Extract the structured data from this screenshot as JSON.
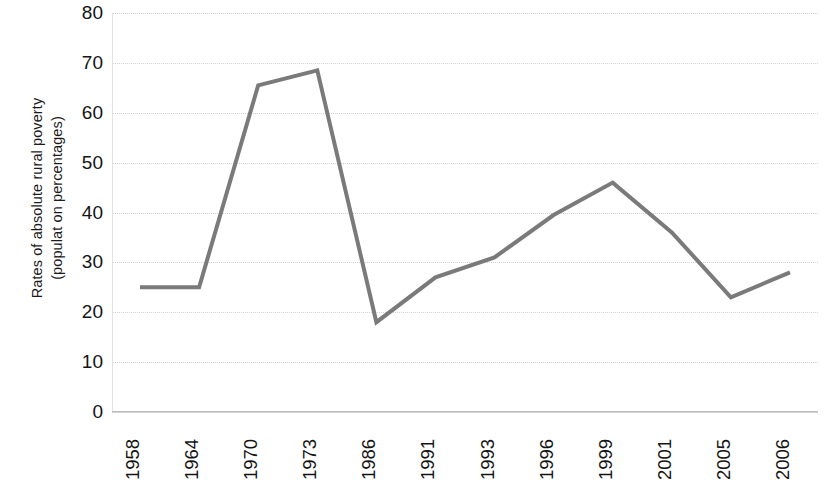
{
  "chart_data": {
    "type": "line",
    "title": "",
    "subtitle": "",
    "xlabel": "",
    "ylabel": "Rates of absolute rural poverty (populat on percentages)",
    "ylabel_lines": [
      "Rates of absolute rural poverty",
      "(populat on percentages)"
    ],
    "categories": [
      "1958",
      "1964",
      "1970",
      "1973",
      "1986",
      "1991",
      "1993",
      "1996",
      "1999",
      "2001",
      "2005",
      "2006"
    ],
    "values": [
      25,
      25,
      65.5,
      68.5,
      18,
      27,
      31,
      39.5,
      46,
      36,
      23,
      28
    ],
    "series": [
      {
        "name": "Rates of absolute rural poverty",
        "values": [
          25,
          25,
          65.5,
          68.5,
          18,
          27,
          31,
          39.5,
          46,
          36,
          23,
          28
        ]
      }
    ],
    "ylim": [
      0,
      80
    ],
    "yticks": [
      0,
      10,
      20,
      30,
      40,
      50,
      60,
      70,
      80
    ],
    "ytick_labels": [
      "0",
      "10",
      "20",
      "30",
      "40",
      "50",
      "60",
      "70",
      "80"
    ],
    "grid": true,
    "grid_axis": "y",
    "legend": false,
    "legend_position": "none",
    "line_color": "#7a7a7a",
    "line_width": 4,
    "marker": "none",
    "background_color": "#ffffff",
    "axis_color": "#bdbdbd",
    "gridline_color": "#d2d2d2",
    "text_color": "#141414",
    "xtick_rotation": 90,
    "ylabel_rotation": 90,
    "annotations": []
  }
}
